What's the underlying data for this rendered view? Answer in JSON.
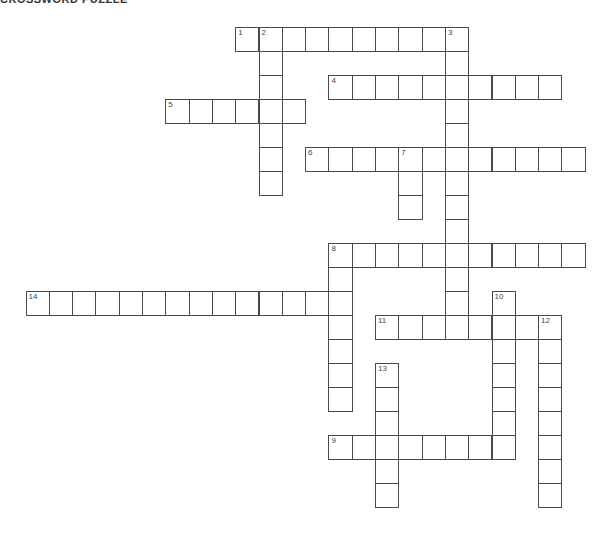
{
  "title": "Crossword Puzzle",
  "grid": {
    "origin_x": 25.5,
    "origin_y": 27,
    "cell_w": 23.3,
    "cell_h": 24.0,
    "line_color": "#4a4a4a"
  },
  "entries": [
    {
      "number": "1",
      "direction": "across",
      "row": 0,
      "col": 9,
      "length": 10
    },
    {
      "number": "2",
      "direction": "down",
      "row": 0,
      "col": 10,
      "length": 7
    },
    {
      "number": "3",
      "direction": "down",
      "row": 0,
      "col": 18,
      "length": 13
    },
    {
      "number": "4",
      "direction": "across",
      "row": 2,
      "col": 13,
      "length": 10
    },
    {
      "number": "5",
      "direction": "across",
      "row": 3,
      "col": 6,
      "length": 6
    },
    {
      "number": "6",
      "direction": "across",
      "row": 5,
      "col": 12,
      "length": 12
    },
    {
      "number": "7",
      "direction": "down",
      "row": 5,
      "col": 16,
      "length": 3
    },
    {
      "number": "8",
      "direction": "across",
      "row": 9,
      "col": 13,
      "length": 11
    },
    {
      "number": "8",
      "direction": "down",
      "row": 9,
      "col": 13,
      "length": 7
    },
    {
      "number": "10",
      "direction": "down",
      "row": 11,
      "col": 20,
      "length": 7
    },
    {
      "number": "14",
      "direction": "across",
      "row": 11,
      "col": 0,
      "length": 14
    },
    {
      "number": "11",
      "direction": "across",
      "row": 12,
      "col": 15,
      "length": 8
    },
    {
      "number": "12",
      "direction": "down",
      "row": 12,
      "col": 22,
      "length": 8
    },
    {
      "number": "13",
      "direction": "down",
      "row": 14,
      "col": 15,
      "length": 6
    },
    {
      "number": "9",
      "direction": "across",
      "row": 17,
      "col": 13,
      "length": 8
    }
  ]
}
